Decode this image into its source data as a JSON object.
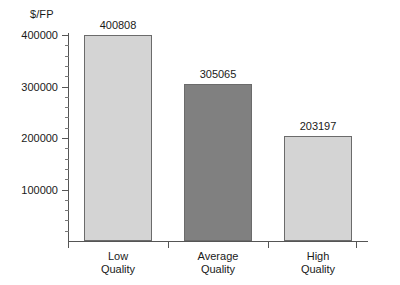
{
  "chart_data": {
    "type": "bar",
    "title": "",
    "xlabel": "",
    "ylabel": "$/FP",
    "categories": [
      "Low Quality",
      "Average Quality",
      "High Quality"
    ],
    "category_lines": [
      [
        "Low",
        "Quality"
      ],
      [
        "Average",
        "Quality"
      ],
      [
        "High",
        "Quality"
      ]
    ],
    "values": [
      400808,
      305065,
      203197
    ],
    "value_labels": [
      "400808",
      "305065",
      "203197"
    ],
    "bar_colors": [
      "#d4d4d4",
      "#808080",
      "#d4d4d4"
    ],
    "bar_border_color": "#6b6b6b",
    "ylim": [
      0,
      400000
    ],
    "yticks": [
      100000,
      200000,
      300000,
      400000
    ],
    "ytick_labels": [
      "100000",
      "200000",
      "300000",
      "400000"
    ],
    "minor_tick_interval": 20000,
    "grid": false,
    "legend": null,
    "axis_color": "#555555"
  }
}
